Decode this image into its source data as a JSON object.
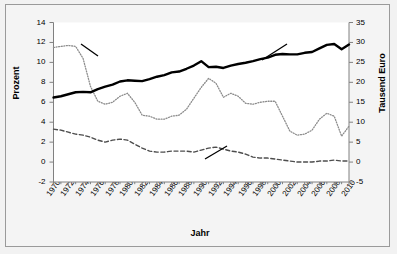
{
  "chart_data": {
    "type": "line",
    "title": "",
    "xlabel": "Jahr",
    "ylabel": "Prozent",
    "ylabel_right": "Tausend Euro",
    "ylim": [
      -2,
      14
    ],
    "ylim_right": [
      -5,
      35
    ],
    "ytick_step": 2,
    "ytick_step_right": 5,
    "grid": false,
    "legend": "annotations-inline",
    "yticks_left": [
      "14",
      "12",
      "10",
      "8",
      "6",
      "4",
      "2",
      "0",
      "-2"
    ],
    "yticks_right": [
      "35",
      "30",
      "25",
      "20",
      "15",
      "10",
      "5",
      "0",
      "-5"
    ],
    "xticks": [
      "1970",
      "1972",
      "1974",
      "1976",
      "1978",
      "1980",
      "1982",
      "1984",
      "1986",
      "1988",
      "1990",
      "1992",
      "1994",
      "1996",
      "1998",
      "2000",
      "2002",
      "2004",
      "2006",
      "2008",
      "2010"
    ],
    "x": [
      1970,
      1971,
      1972,
      1973,
      1974,
      1975,
      1976,
      1977,
      1978,
      1979,
      1980,
      1981,
      1982,
      1983,
      1984,
      1985,
      1986,
      1987,
      1988,
      1989,
      1990,
      1991,
      1992,
      1993,
      1994,
      1995,
      1996,
      1997,
      1998,
      1999,
      2000,
      2001,
      2002,
      2003,
      2004,
      2005,
      2006,
      2007,
      2008,
      2009,
      2010
    ],
    "series": [
      {
        "name": "Private Nettoinvestitionsquote (linke Skala)",
        "axis": "left",
        "style": "dotted",
        "color": "#8c8c8c",
        "unit": "Prozent",
        "values": [
          11.5,
          11.6,
          11.7,
          11.6,
          10.4,
          7.6,
          6.1,
          5.8,
          6.0,
          6.6,
          6.9,
          6.0,
          4.7,
          4.6,
          4.3,
          4.3,
          4.6,
          4.7,
          5.3,
          6.4,
          7.5,
          8.4,
          7.9,
          6.5,
          6.9,
          6.6,
          5.9,
          5.8,
          6.0,
          6.1,
          6.1,
          4.6,
          3.1,
          2.7,
          2.8,
          3.2,
          4.3,
          4.9,
          4.6,
          2.6,
          3.6
        ]
      },
      {
        "name": "Reales Pro-Kopf-Einkommen (rechte Skala)",
        "axis": "right",
        "style": "solid",
        "color": "#000000",
        "unit": "Tausend Euro",
        "values": [
          16.2,
          16.5,
          17.0,
          17.5,
          17.6,
          17.5,
          18.3,
          18.9,
          19.4,
          20.2,
          20.5,
          20.4,
          20.3,
          20.8,
          21.4,
          21.8,
          22.5,
          22.7,
          23.4,
          24.2,
          25.3,
          23.8,
          23.9,
          23.6,
          24.2,
          24.6,
          24.9,
          25.3,
          25.8,
          26.2,
          26.9,
          27.1,
          27.0,
          27.0,
          27.4,
          27.6,
          28.5,
          29.4,
          29.6,
          28.3,
          29.5
        ]
      },
      {
        "name": "Öffentliche Nettoinvestitionsquote (linke Skala)",
        "axis": "left",
        "style": "dashed",
        "color": "#4d4d4d",
        "unit": "Prozent",
        "values": [
          3.3,
          3.2,
          3.0,
          2.8,
          2.7,
          2.5,
          2.2,
          2.0,
          2.2,
          2.3,
          2.2,
          1.8,
          1.4,
          1.1,
          1.0,
          1.0,
          1.1,
          1.1,
          1.1,
          1.0,
          1.2,
          1.4,
          1.5,
          1.3,
          1.1,
          1.0,
          0.8,
          0.5,
          0.4,
          0.4,
          0.3,
          0.2,
          0.1,
          0.0,
          0.0,
          0.0,
          0.1,
          0.1,
          0.2,
          0.1,
          0.1
        ]
      }
    ],
    "annotations": [
      {
        "id": "private",
        "lines": [
          "Private",
          "Nettoinvestitionsquote",
          "(linke Skala)"
        ]
      },
      {
        "id": "real_income",
        "lines": [
          "Reales Pro-Kopf-",
          "Einkommen",
          "(rechte Skala)"
        ]
      },
      {
        "id": "public",
        "lines": [
          "Öffentliche",
          "Nettoinvestitionsquote",
          "(linke Skala)"
        ]
      }
    ]
  }
}
